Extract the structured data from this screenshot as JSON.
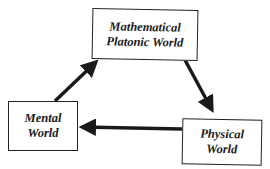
{
  "diagram": {
    "nodes": [
      {
        "id": "mathematical",
        "lines": [
          "Mathematical",
          "Platonic World"
        ]
      },
      {
        "id": "mental",
        "lines": [
          "Mental",
          "World"
        ]
      },
      {
        "id": "physical",
        "lines": [
          "Physical",
          "World"
        ]
      }
    ],
    "edges": [
      {
        "from": "mental",
        "to": "mathematical"
      },
      {
        "from": "mathematical",
        "to": "physical"
      },
      {
        "from": "physical",
        "to": "mental"
      }
    ],
    "colors": {
      "stroke": "#1a1a1a",
      "background": "#ffffff"
    }
  }
}
